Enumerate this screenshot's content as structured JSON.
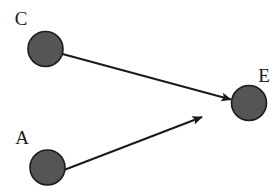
{
  "diagram": {
    "type": "directed-graph",
    "title": "",
    "background_color": "#ffffff",
    "node_fill_color": "#555555",
    "node_stroke_color": "#1c1c1c",
    "edge_color": "#1a1a1a",
    "label_color": "#1a1a1a",
    "nodes": [
      {
        "id": "C",
        "label": "C",
        "cx": 45.5,
        "cy": 49.0,
        "r": 17.5,
        "label_x": 21,
        "label_y": 25
      },
      {
        "id": "E",
        "label": "E",
        "cx": 249.0,
        "cy": 103.0,
        "r": 17.5,
        "label_x": 264,
        "label_y": 82
      },
      {
        "id": "A",
        "label": "A",
        "cx": 47.5,
        "cy": 167.5,
        "r": 17.5,
        "label_x": 22,
        "label_y": 144
      }
    ],
    "edges": [
      {
        "id": "C-E",
        "from": "C",
        "to": "E",
        "x1": 62.5,
        "y1": 54.0,
        "x2": 231.0,
        "y2": 99.5,
        "directed": true
      },
      {
        "id": "A-E",
        "from": "A",
        "to": "E",
        "x1": 64.0,
        "y1": 170.0,
        "x2": 202.0,
        "y2": 117.0,
        "directed": true
      }
    ]
  }
}
